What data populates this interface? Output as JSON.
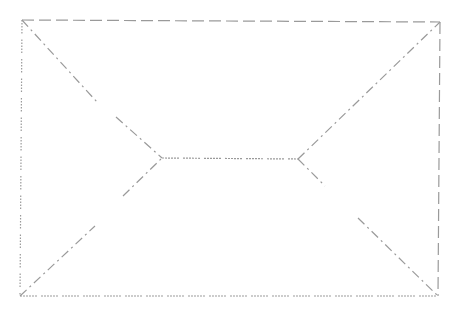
{
  "diagram": {
    "width": 466,
    "height": 311,
    "background": "#ffffff",
    "stroke_color": "#9a9a9a",
    "stroke_width": 1.2,
    "styles": {
      "dashed": "12 5",
      "dotted_dash": "2 1 2 1 2 1 2 1 2 1 2 4",
      "dash_dot": "9 4 2 4",
      "dotted": "1.5 1.5 1.5 1.5 1.5 1.5 1.5 1.5 1.5 6"
    },
    "nodes": {
      "top_left": [
        22,
        20
      ],
      "top_right": [
        440,
        22
      ],
      "bottom_left": [
        20,
        296
      ],
      "bottom_right": [
        438,
        296
      ],
      "left_junction": [
        162,
        158
      ],
      "right_junction": [
        298,
        159
      ]
    },
    "edges": [
      {
        "id": "top-edge",
        "from": [
          22,
          20
        ],
        "to": [
          440,
          22
        ],
        "style": "dashed"
      },
      {
        "id": "right-edge",
        "from": [
          440,
          22
        ],
        "to": [
          438,
          296
        ],
        "style": "dashed"
      },
      {
        "id": "bottom-edge",
        "from": [
          20,
          296
        ],
        "to": [
          438,
          296
        ],
        "style": "dotted_dash"
      },
      {
        "id": "left-edge",
        "from": [
          22,
          20
        ],
        "to": [
          20,
          296
        ],
        "style": "dotted"
      },
      {
        "id": "upper-left-diagonal-a",
        "from": [
          22,
          20
        ],
        "to": [
          97,
          102
        ],
        "style": "dash_dot"
      },
      {
        "id": "upper-left-diagonal-b",
        "from": [
          116,
          117
        ],
        "to": [
          162,
          158
        ],
        "style": "dash_dot"
      },
      {
        "id": "lower-left-diagonal-a",
        "from": [
          20,
          296
        ],
        "to": [
          95,
          226
        ],
        "style": "dash_dot"
      },
      {
        "id": "lower-left-diagonal-b",
        "from": [
          123,
          196
        ],
        "to": [
          162,
          158
        ],
        "style": "dash_dot"
      },
      {
        "id": "middle-horizontal",
        "from": [
          162,
          158
        ],
        "to": [
          298,
          159
        ],
        "style": "dotted_dash"
      },
      {
        "id": "upper-right-diagonal",
        "from": [
          298,
          159
        ],
        "to": [
          440,
          22
        ],
        "style": "dash_dot"
      },
      {
        "id": "lower-right-diagonal-a",
        "from": [
          298,
          159
        ],
        "to": [
          325,
          186
        ],
        "style": "dash_dot"
      },
      {
        "id": "lower-right-diagonal-b",
        "from": [
          358,
          218
        ],
        "to": [
          438,
          296
        ],
        "style": "dash_dot"
      }
    ]
  }
}
